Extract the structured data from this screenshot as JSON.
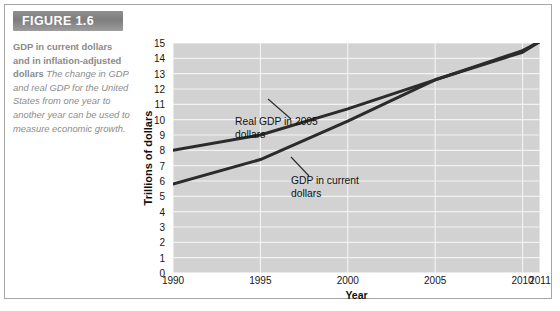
{
  "figure": {
    "badge_label": "FIGURE 1.6",
    "caption_bold": "GDP in current dollars and in inflation-adjusted dollars",
    "caption_italic": "The change in GDP and real GDP for the United States from one year to another year can be used to measure economic growth.",
    "border_color": "#a6a6a6",
    "badge_color": "#7d7d7d",
    "caption_text_color": "#8c8c8c"
  },
  "chart_data": {
    "type": "line",
    "title": "",
    "xlabel": "Year",
    "ylabel": "Trillions of dollars",
    "xticklabels": [
      "1990",
      "1995",
      "2000",
      "2005",
      "2010",
      "2011"
    ],
    "xtickvalues": [
      1990,
      1995,
      2000,
      2005,
      2010,
      2011
    ],
    "xlim": [
      1990,
      2011
    ],
    "ylim": [
      0,
      15
    ],
    "yticklabels": [
      "0",
      "1",
      "2",
      "3",
      "4",
      "5",
      "6",
      "7",
      "8",
      "9",
      "10",
      "11",
      "12",
      "13",
      "14",
      "15"
    ],
    "ytickvalues": [
      0,
      1,
      2,
      3,
      4,
      5,
      6,
      7,
      8,
      9,
      10,
      11,
      12,
      13,
      14,
      15
    ],
    "grid": "horizontal-and-vertical",
    "plot_background": "#d2d2d2",
    "gridline_color": "#f2f2f2",
    "line_color": "#2b2b2b",
    "legend": "annotations-inline",
    "x": [
      1990,
      1995,
      2000,
      2005,
      2010,
      2011
    ],
    "series": [
      {
        "name": "Real GDP in 2005 dollars",
        "values": [
          8.0,
          9.0,
          10.7,
          12.6,
          14.5,
          15.1
        ]
      },
      {
        "name": "GDP in current dollars",
        "values": [
          5.8,
          7.4,
          9.9,
          12.6,
          14.4,
          15.1
        ]
      }
    ],
    "annotations": [
      {
        "text_line1": "Real GDP in 2005",
        "text_line2": "dollars"
      },
      {
        "text_line1": "GDP in current",
        "text_line2": "dollars"
      }
    ]
  }
}
